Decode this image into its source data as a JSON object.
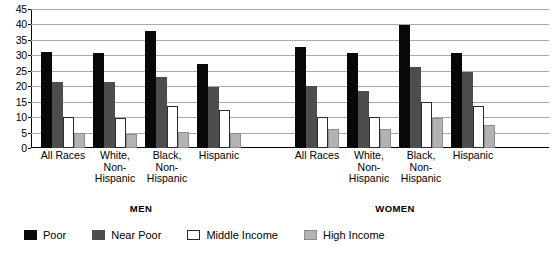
{
  "chart_data": {
    "type": "bar",
    "title": "",
    "xlabel": "",
    "ylabel": "",
    "ylim": [
      0,
      45
    ],
    "ytick_step": 5,
    "yticks": [
      "45",
      "40",
      "35",
      "30",
      "25",
      "20",
      "15",
      "10",
      "5",
      "0"
    ],
    "grid": true,
    "legend_position": "bottom-left",
    "sections": [
      {
        "name": "MEN",
        "categories": [
          "All Races",
          "White,\nNon-\nHispanic",
          "Black,\nNon-\nHispanic",
          "Hispanic"
        ],
        "series": [
          {
            "name": "Poor",
            "values": [
              31.0,
              30.7,
              38.0,
              27.2
            ]
          },
          {
            "name": "Near Poor",
            "values": [
              21.3,
              21.5,
              23.0,
              19.7
            ]
          },
          {
            "name": "Middle Income",
            "values": [
              10.0,
              9.8,
              13.5,
              12.2
            ]
          },
          {
            "name": "High Income",
            "values": [
              4.8,
              4.6,
              5.2,
              5.0
            ]
          }
        ]
      },
      {
        "name": "WOMEN",
        "categories": [
          "All Races",
          "White,\nNon-\nHispanic",
          "Black,\nNon-\nHispanic",
          "Hispanic"
        ],
        "series": [
          {
            "name": "Poor",
            "values": [
              32.6,
              30.6,
              39.8,
              30.7
            ]
          },
          {
            "name": "Near Poor",
            "values": [
              20.2,
              18.5,
              26.3,
              24.7
            ]
          },
          {
            "name": "Middle Income",
            "values": [
              10.2,
              10.0,
              15.0,
              13.5
            ]
          },
          {
            "name": "High Income",
            "values": [
              6.2,
              6.0,
              9.7,
              7.5
            ]
          }
        ]
      }
    ],
    "legend": [
      {
        "name": "Poor",
        "key": "poor",
        "color": "#080808"
      },
      {
        "name": "Near Poor",
        "key": "nearpoor",
        "color": "#4d4d4d"
      },
      {
        "name": "Middle Income",
        "key": "middle",
        "color": "#ffffff"
      },
      {
        "name": "High Income",
        "key": "high",
        "color": "#b3b3b3"
      }
    ]
  }
}
